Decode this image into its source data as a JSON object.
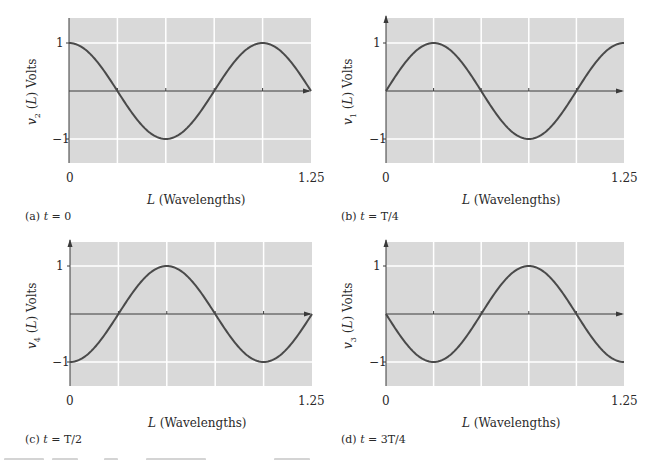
{
  "figure": {
    "background": "#ffffff",
    "plot_background": "#d9d9d9",
    "grid_color": "#ffffff",
    "curve_color": "#4a4a4a",
    "axis_color": "#3a3a3a",
    "truncated_caption_visible": true
  },
  "panels": [
    {
      "id": "a",
      "ylabel_var": "v",
      "ylabel_sub": "2",
      "ylabel_rest": " (",
      "ylabel_L": "L",
      "ylabel_end": ") Volts",
      "ytick_top": "1",
      "ytick_bottom": "−1",
      "xtick_left": "0",
      "xtick_right": "1.25",
      "xlabel_L": "L",
      "xlabel_rest": " (Wavelengths)",
      "caption_prefix": "(a) ",
      "caption_t": "t",
      "caption_eq": " = 0"
    },
    {
      "id": "b",
      "ylabel_var": "v",
      "ylabel_sub": "1",
      "ylabel_rest": " (",
      "ylabel_L": "L",
      "ylabel_end": ") Volts",
      "ytick_top": "1",
      "ytick_bottom": "−1",
      "xtick_left": "0",
      "xtick_right": "1.25",
      "xlabel_L": "L",
      "xlabel_rest": " (Wavelengths)",
      "caption_prefix": "(b) ",
      "caption_t": "t",
      "caption_eq": " = T/4"
    },
    {
      "id": "c",
      "ylabel_var": "v",
      "ylabel_sub": "4",
      "ylabel_rest": " (",
      "ylabel_L": "L",
      "ylabel_end": ") Volts",
      "ytick_top": "1",
      "ytick_bottom": "−1",
      "xtick_left": "0",
      "xtick_right": "1.25",
      "xlabel_L": "L",
      "xlabel_rest": " (Wavelengths)",
      "caption_prefix": "(c) ",
      "caption_t": "t",
      "caption_eq": " = T/2"
    },
    {
      "id": "d",
      "ylabel_var": "v",
      "ylabel_sub": "3",
      "ylabel_rest": " (",
      "ylabel_L": "L",
      "ylabel_end": ") Volts",
      "ytick_top": "1",
      "ytick_bottom": "−1",
      "xtick_left": "0",
      "xtick_right": "1.25",
      "xlabel_L": "L",
      "xlabel_rest": " (Wavelengths)",
      "caption_prefix": "(d) ",
      "caption_t": "t",
      "caption_eq": " = 3T/4"
    }
  ],
  "chart_data": [
    {
      "type": "line",
      "title": "(a) t = 0",
      "xlabel": "L (Wavelengths)",
      "ylabel": "v2 (L) Volts",
      "xlim": [
        0,
        1.25
      ],
      "ylim": [
        -1.25,
        1.25
      ],
      "xticks": [
        0,
        1.25
      ],
      "yticks": [
        1,
        -1
      ],
      "grid": true,
      "grid_x": [
        0.25,
        0.5,
        0.75,
        1.0
      ],
      "grid_y": [
        1,
        -1
      ],
      "x": [
        0,
        0.125,
        0.25,
        0.375,
        0.5,
        0.625,
        0.75,
        0.875,
        1.0,
        1.125,
        1.25
      ],
      "series": [
        {
          "name": "v2(L)",
          "function": "cos(2*pi*L)",
          "phase_deg": 90,
          "values": [
            1,
            0.707,
            0,
            -0.707,
            -1,
            -0.707,
            0,
            0.707,
            1,
            0.707,
            0
          ]
        }
      ]
    },
    {
      "type": "line",
      "title": "(b) t = T/4",
      "xlabel": "L (Wavelengths)",
      "ylabel": "v1 (L) Volts",
      "xlim": [
        0,
        1.25
      ],
      "ylim": [
        -1.25,
        1.25
      ],
      "xticks": [
        0,
        1.25
      ],
      "yticks": [
        1,
        -1
      ],
      "grid": true,
      "grid_x": [
        0.25,
        0.5,
        0.75,
        1.0
      ],
      "grid_y": [
        1,
        -1
      ],
      "x": [
        0,
        0.125,
        0.25,
        0.375,
        0.5,
        0.625,
        0.75,
        0.875,
        1.0,
        1.125,
        1.25
      ],
      "series": [
        {
          "name": "v1(L)",
          "function": "sin(2*pi*L)",
          "phase_deg": 0,
          "values": [
            0,
            0.707,
            1,
            0.707,
            0,
            -0.707,
            -1,
            -0.707,
            0,
            0.707,
            1
          ]
        }
      ]
    },
    {
      "type": "line",
      "title": "(c) t = T/2",
      "xlabel": "L (Wavelengths)",
      "ylabel": "v4 (L) Volts",
      "xlim": [
        0,
        1.25
      ],
      "ylim": [
        -1.25,
        1.25
      ],
      "xticks": [
        0,
        1.25
      ],
      "yticks": [
        1,
        -1
      ],
      "grid": true,
      "grid_x": [
        0.25,
        0.5,
        0.75,
        1.0
      ],
      "grid_y": [
        1,
        -1
      ],
      "x": [
        0,
        0.125,
        0.25,
        0.375,
        0.5,
        0.625,
        0.75,
        0.875,
        1.0,
        1.125,
        1.25
      ],
      "series": [
        {
          "name": "v4(L)",
          "function": "-cos(2*pi*L)",
          "phase_deg": 270,
          "values": [
            -1,
            -0.707,
            0,
            0.707,
            1,
            0.707,
            0,
            -0.707,
            -1,
            -0.707,
            0
          ]
        }
      ]
    },
    {
      "type": "line",
      "title": "(d) t = 3T/4",
      "xlabel": "L (Wavelengths)",
      "ylabel": "v3 (L) Volts",
      "xlim": [
        0,
        1.25
      ],
      "ylim": [
        -1.25,
        1.25
      ],
      "xticks": [
        0,
        1.25
      ],
      "yticks": [
        1,
        -1
      ],
      "grid": true,
      "grid_x": [
        0.25,
        0.5,
        0.75,
        1.0
      ],
      "grid_y": [
        1,
        -1
      ],
      "x": [
        0,
        0.125,
        0.25,
        0.375,
        0.5,
        0.625,
        0.75,
        0.875,
        1.0,
        1.125,
        1.25
      ],
      "series": [
        {
          "name": "v3(L)",
          "function": "-sin(2*pi*L)",
          "phase_deg": 180,
          "values": [
            0,
            -0.707,
            -1,
            -0.707,
            0,
            0.707,
            1,
            0.707,
            0,
            -0.707,
            -1
          ]
        }
      ]
    }
  ]
}
